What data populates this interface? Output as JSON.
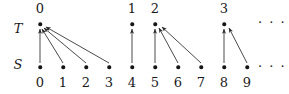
{
  "figure": {
    "title_labels": {
      "top_set": "T",
      "bottom_set": "S"
    },
    "ellipsis_top": "· · ·",
    "ellipsis_bottom": "· · ·",
    "colors": {
      "ink": "#1a1a1a",
      "node": "#151515",
      "arrow": "#2a2a2a",
      "background": "#ffffff"
    }
  },
  "chart_data": {
    "type": "diagram",
    "title": "",
    "xlabel": "",
    "ylabel": "",
    "rows": [
      {
        "name": "T",
        "label": "T",
        "y": 24,
        "nodes": [
          {
            "label": "0",
            "x": 40
          },
          {
            "label": "1",
            "x": 132
          },
          {
            "label": "2",
            "x": 155
          },
          {
            "label": "3",
            "x": 224
          }
        ]
      },
      {
        "name": "S",
        "label": "S",
        "y": 67,
        "nodes": [
          {
            "label": "0",
            "x": 40
          },
          {
            "label": "1",
            "x": 63
          },
          {
            "label": "2",
            "x": 86
          },
          {
            "label": "3",
            "x": 109
          },
          {
            "label": "4",
            "x": 132
          },
          {
            "label": "5",
            "x": 155
          },
          {
            "label": "6",
            "x": 178
          },
          {
            "label": "7",
            "x": 201
          },
          {
            "label": "8",
            "x": 224
          },
          {
            "label": "9",
            "x": 247
          }
        ]
      }
    ],
    "edges": [
      {
        "from": "S0",
        "to": "T0",
        "x1": 40,
        "y1": 63,
        "x2": 40,
        "y2": 29
      },
      {
        "from": "S1",
        "to": "T0",
        "x1": 63,
        "y1": 63,
        "x2": 42,
        "y2": 29
      },
      {
        "from": "S2",
        "to": "T0",
        "x1": 86,
        "y1": 63,
        "x2": 44,
        "y2": 28
      },
      {
        "from": "S3",
        "to": "T0",
        "x1": 109,
        "y1": 63,
        "x2": 46,
        "y2": 27
      },
      {
        "from": "S4",
        "to": "T1",
        "x1": 132,
        "y1": 63,
        "x2": 132,
        "y2": 29
      },
      {
        "from": "S5",
        "to": "T2",
        "x1": 155,
        "y1": 63,
        "x2": 155,
        "y2": 29
      },
      {
        "from": "S6",
        "to": "T2",
        "x1": 178,
        "y1": 63,
        "x2": 159,
        "y2": 28
      },
      {
        "from": "S7",
        "to": "T2",
        "x1": 201,
        "y1": 63,
        "x2": 162,
        "y2": 27
      },
      {
        "from": "S8",
        "to": "T3",
        "x1": 224,
        "y1": 63,
        "x2": 224,
        "y2": 29
      },
      {
        "from": "S9",
        "to": "T3",
        "x1": 247,
        "y1": 63,
        "x2": 229,
        "y2": 28
      }
    ],
    "legend": [],
    "annotations": [
      {
        "text": "· · ·",
        "x": 266,
        "y": 22
      },
      {
        "text": "· · ·",
        "x": 266,
        "y": 66
      }
    ]
  }
}
